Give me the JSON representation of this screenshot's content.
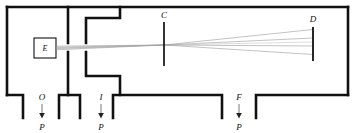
{
  "figure": {
    "type": "schematic-cross-section",
    "title": "",
    "background_color": "#ffffff",
    "line_color": "#111111",
    "beam_color": "#8a8a8a",
    "width": 356,
    "height": 133
  },
  "labels": {
    "source_box": "E",
    "crossover": "C",
    "detector": "D",
    "port_o": "O",
    "port_i": "I",
    "port_f": "F",
    "pump_left": "P",
    "pump_mid": "P",
    "pump_right": "P"
  },
  "components": [
    {
      "name": "source-box",
      "label": "E",
      "x": 34,
      "y": 38,
      "w": 22,
      "h": 20
    },
    {
      "name": "crossover-aperture",
      "label": "C",
      "x": 164,
      "y": 22,
      "h": 44
    },
    {
      "name": "detector-plate",
      "label": "D",
      "x": 313,
      "y": 27,
      "h": 34
    }
  ],
  "beam": {
    "rays": 4,
    "origin_x": 56,
    "origin_y": 48,
    "crossover_x": 164,
    "crossover_y": 45,
    "detector_x": 313,
    "spread_at_origin": 3,
    "spread_at_detector": 15
  },
  "pump_ports": [
    {
      "name": "port-o",
      "label": "O",
      "pump_label": "P",
      "x": 42,
      "arrow_top": 95,
      "arrow_bottom": 118
    },
    {
      "name": "port-i",
      "label": "I",
      "pump_label": "P",
      "x": 101,
      "arrow_top": 95,
      "arrow_bottom": 118
    },
    {
      "name": "port-f",
      "label": "F",
      "pump_label": "P",
      "x": 239,
      "arrow_top": 95,
      "arrow_bottom": 118
    }
  ],
  "chamber_walls": {
    "outer_top_y": 7,
    "outer_left_x": 7,
    "outer_right_x": 348,
    "baffle_1_x": 68,
    "baffle_2_x": 86,
    "step_wall_x": 120
  }
}
